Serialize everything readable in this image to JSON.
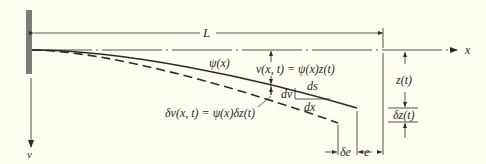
{
  "diagram": {
    "type": "cantilever beam deflection (generalized coordinate)",
    "colors": {
      "background": "#fdfcf1",
      "ink": "#2a2a2a",
      "wall": "#7a7a7a"
    },
    "labels": {
      "length": "L",
      "x_axis": "x",
      "v_axis": "v",
      "shape_function": "ψ(x)",
      "displacement": "v(x, t) = ψ(x)z(t)",
      "virtual_displacement": "δv(x, t) = ψ(x)δz(t)",
      "ds": "ds",
      "dv": "dv",
      "dx": "dx",
      "z": "z(t)",
      "delta_z": "δz(t)",
      "delta_e": "δe",
      "e": "e"
    }
  }
}
